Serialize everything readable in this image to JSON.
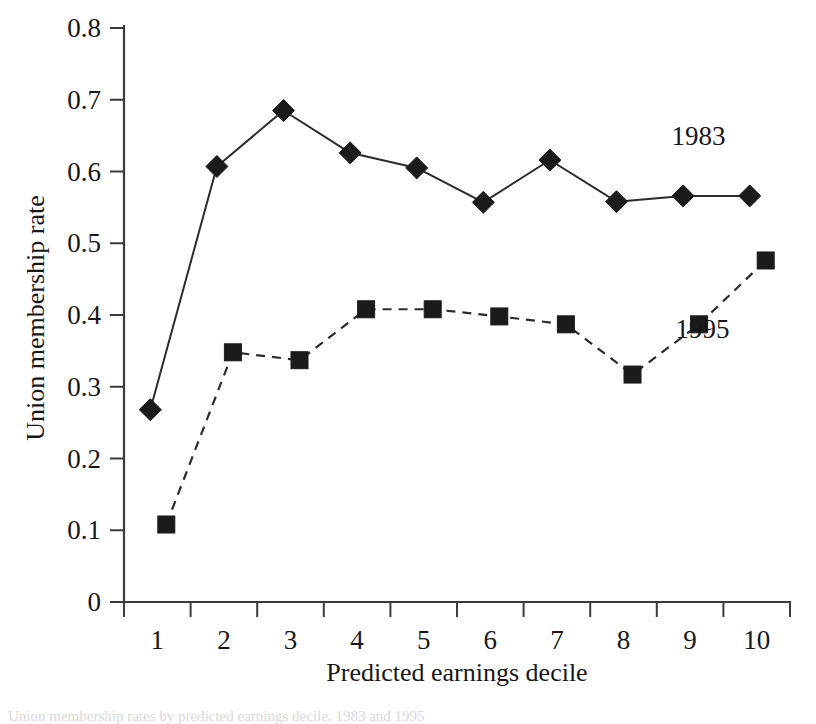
{
  "chart_data": {
    "type": "line",
    "title": "",
    "xlabel": "Predicted earnings decile",
    "ylabel": "Union membership rate",
    "categories": [
      "1",
      "2",
      "3",
      "4",
      "5",
      "6",
      "7",
      "8",
      "9",
      "10"
    ],
    "x": [
      1,
      2,
      3,
      4,
      5,
      6,
      7,
      8,
      9,
      10
    ],
    "xlim": [
      0.5,
      10.5
    ],
    "ylim": [
      0,
      0.8
    ],
    "yticks": [
      "0",
      "0.1",
      "0.2",
      "0.3",
      "0.4",
      "0.5",
      "0.6",
      "0.7",
      "0.8"
    ],
    "ytick_values": [
      0,
      0.1,
      0.2,
      0.3,
      0.4,
      0.5,
      0.6,
      0.7,
      0.8
    ],
    "grid": false,
    "legend_position": "inline-annotation",
    "series": [
      {
        "name": "1983",
        "marker": "diamond",
        "linestyle": "solid",
        "color": "#1b1b1b",
        "values": [
          0.268,
          0.607,
          0.685,
          0.626,
          0.605,
          0.557,
          0.616,
          0.558,
          0.566,
          0.566
        ]
      },
      {
        "name": "1995",
        "marker": "square",
        "linestyle": "dashed",
        "color": "#1b1b1b",
        "values": [
          0.108,
          0.348,
          0.337,
          0.408,
          0.408,
          0.398,
          0.387,
          0.317,
          0.387,
          0.476
        ]
      }
    ],
    "annotations": [
      {
        "text": "1983",
        "x": 8.72,
        "y": 0.637
      },
      {
        "text": "1995",
        "x": 8.78,
        "y": 0.368
      }
    ]
  },
  "caption": {
    "text": "Union membership rates by predicted earnings decile, 1983 and 1995"
  }
}
